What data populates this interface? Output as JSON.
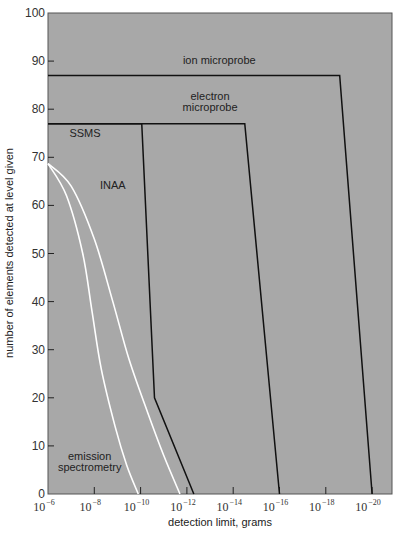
{
  "chart_data": {
    "type": "line",
    "title": "",
    "xlabel": "detection limit, grams",
    "ylabel": "number of elements detected at level given",
    "x_scale": "log",
    "x_ticks": [
      {
        "exp": -6,
        "label": "10",
        "sup": "−6"
      },
      {
        "exp": -8,
        "label": "10",
        "sup": "−8"
      },
      {
        "exp": -10,
        "label": "10",
        "sup": "−10"
      },
      {
        "exp": -12,
        "label": "10",
        "sup": "−12"
      },
      {
        "exp": -14,
        "label": "10",
        "sup": "−14"
      },
      {
        "exp": -16,
        "label": "10",
        "sup": "−16"
      },
      {
        "exp": -18,
        "label": "10",
        "sup": "−18"
      },
      {
        "exp": -20,
        "label": "10",
        "sup": "−20"
      }
    ],
    "y_ticks": [
      0,
      10,
      20,
      30,
      40,
      50,
      60,
      70,
      80,
      90,
      100
    ],
    "xlim_exp": [
      -6,
      -21.2
    ],
    "ylim": [
      0,
      100
    ],
    "grid": false,
    "background": "#a8a8a8",
    "series": [
      {
        "name": "ion microprobe",
        "color": "#111111",
        "style": "line",
        "points_exp": [
          [
            -6,
            87
          ],
          [
            -18.6,
            87
          ],
          [
            -20,
            0
          ]
        ],
        "label_pos": [
          -13.4,
          89.5
        ]
      },
      {
        "name": "electron microprobe",
        "color": "#111111",
        "style": "line",
        "label_lines": [
          "electron",
          "microprobe"
        ],
        "points_exp": [
          [
            -6,
            77
          ],
          [
            -14.5,
            77
          ],
          [
            -16,
            0
          ]
        ],
        "label_pos": [
          -13.0,
          82
        ]
      },
      {
        "name": "SSMS",
        "color": "#111111",
        "style": "line",
        "points_exp": [
          [
            -6,
            77
          ],
          [
            -10.05,
            77
          ],
          [
            -10.6,
            20
          ],
          [
            -12.3,
            0
          ]
        ],
        "label_pos": [
          -7.6,
          74.3
        ]
      },
      {
        "name": "INAA",
        "color": "#ffffff",
        "style": "curve",
        "points_exp": [
          [
            -6,
            68.7
          ],
          [
            -7,
            64
          ],
          [
            -8,
            53
          ],
          [
            -8.8,
            40
          ],
          [
            -9.5,
            28
          ],
          [
            -10.3,
            17
          ],
          [
            -11,
            8
          ],
          [
            -11.7,
            0
          ]
        ],
        "label_pos": [
          -8.8,
          63.5
        ]
      },
      {
        "name": "emission spectrometry",
        "color": "#ffffff",
        "style": "curve",
        "label_lines": [
          "emission",
          "spectrometry"
        ],
        "points_exp": [
          [
            -6,
            68.7
          ],
          [
            -6.8,
            62
          ],
          [
            -7.5,
            50
          ],
          [
            -7.9,
            38
          ],
          [
            -8.3,
            26
          ],
          [
            -8.9,
            14
          ],
          [
            -9.4,
            6
          ],
          [
            -9.9,
            0
          ]
        ],
        "label_pos": [
          -7.8,
          7
        ]
      }
    ]
  }
}
